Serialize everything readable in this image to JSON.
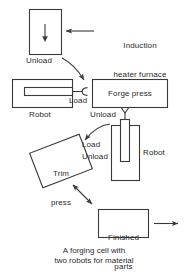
{
  "figure": {
    "title": "A forging cell with two robots for material",
    "caption_lines": [
      "A forging cell with",
      "two robots for material"
    ],
    "background_color": "#ffffff",
    "line_color": "#3a3a3a",
    "text_color": "#2b2b2b"
  },
  "nodes": {
    "furnace": {
      "label": "Induction\nheater furnace",
      "label_line1": "Induction",
      "label_line2": "heater furnace",
      "box_label": "",
      "unload_label": "Unload",
      "arrow_inside": "down-arrow"
    },
    "robot_left": {
      "label": "Robot",
      "load_label": "Load",
      "arm": "horizontal-arm",
      "gripper": "c-gripper"
    },
    "forge_press": {
      "label": "Forge press",
      "unload_label": "Unload",
      "gripper": "y-gripper"
    },
    "robot_right": {
      "label": "Robot",
      "arm": "vertical-arm"
    },
    "trim_press": {
      "label_line1": "Trim",
      "label_line2": "press",
      "load_label": "Load",
      "unload_label": "Unload",
      "rotation_deg": -21
    },
    "finished_parts": {
      "label_line1": "Finished",
      "label_line2": "parts",
      "exit_arrow": "right-arrow"
    }
  },
  "flows": [
    {
      "name": "furnace-to-forge",
      "from": "furnace",
      "to": "forge-press-area",
      "style": "curved",
      "heads": 1
    },
    {
      "name": "forge-to-trim",
      "from": "forge-press-area",
      "to": "trim-press",
      "style": "curved",
      "heads": 1
    },
    {
      "name": "trim-to-finished",
      "from": "trim-press",
      "to": "finished-parts",
      "style": "straight",
      "heads": 2
    },
    {
      "name": "furnace-callout",
      "from": "label",
      "to": "furnace",
      "style": "straight",
      "heads": 1
    },
    {
      "name": "finished-parts-out",
      "from": "finished-parts",
      "to": "exit",
      "style": "straight",
      "heads": 1
    }
  ]
}
